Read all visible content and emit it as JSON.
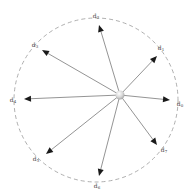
{
  "diagram": {
    "title": "",
    "circle": {
      "cx": 96,
      "cy": 100,
      "r": 82,
      "stroke": "#9a9a9a",
      "dash": "4,3"
    },
    "center": {
      "x": 120,
      "y": 95,
      "r": 4.5
    },
    "arrow_color": "#666666",
    "head_color": "#1a1a1a",
    "directions": [
      {
        "label": "d",
        "sub": "0",
        "tip": [
          170,
          100
        ],
        "label_pos": [
          180,
          104
        ]
      },
      {
        "label": "d",
        "sub": "1",
        "tip": [
          157,
          56
        ],
        "label_pos": [
          161,
          48
        ]
      },
      {
        "label": "d",
        "sub": "2",
        "tip": [
          99,
          25
        ],
        "label_pos": [
          96,
          16
        ]
      },
      {
        "label": "d",
        "sub": "3",
        "tip": [
          42,
          50
        ],
        "label_pos": [
          35,
          45
        ]
      },
      {
        "label": "d",
        "sub": "4",
        "tip": [
          24,
          99
        ],
        "label_pos": [
          13,
          100
        ]
      },
      {
        "label": "d",
        "sub": "5",
        "tip": [
          46,
          154
        ],
        "label_pos": [
          36,
          159
        ]
      },
      {
        "label": "d",
        "sub": "6",
        "tip": [
          99,
          176
        ],
        "label_pos": [
          97,
          186
        ]
      },
      {
        "label": "d",
        "sub": "7",
        "tip": [
          157,
          145
        ],
        "label_pos": [
          164,
          150
        ]
      }
    ]
  }
}
